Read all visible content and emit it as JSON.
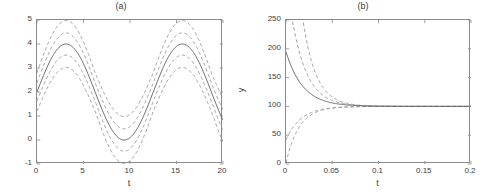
{
  "figure": {
    "width": 484,
    "height": 196,
    "background": "#ffffff",
    "axis_color": "#8a8a8a",
    "text_color": "#3c3c3c",
    "mean_line_color": "#555555",
    "band_line_color": "#8d8d8d"
  },
  "chart_data": [
    {
      "type": "line",
      "panel": "a",
      "title": "(a)",
      "xlabel": "t",
      "ylabel": "y",
      "xlim": [
        0,
        20
      ],
      "ylim": [
        -1,
        5
      ],
      "xticks": [
        0,
        5,
        10,
        15,
        20
      ],
      "xticklabels": [
        "0",
        "5",
        "10",
        "15",
        "20"
      ],
      "yticks": [
        -1,
        0,
        1,
        2,
        3,
        4,
        5
      ],
      "yticklabels": [
        "-1",
        "0",
        "1",
        "2",
        "3",
        "4",
        "5"
      ],
      "grid": false,
      "legend": null,
      "description": "Sinusoidal mean solution with four dashed confidence/percentile bands",
      "series": [
        {
          "name": "mean",
          "style": "solid",
          "color": "#555555",
          "model": "sine",
          "offset": 2.0,
          "amplitude": 2.0,
          "period": 12.5,
          "phase_t0_value": 2.0,
          "peaks_t": [
            3.1,
            15.6
          ],
          "peaks_y": [
            4.0,
            4.0
          ],
          "troughs_t": [
            9.4
          ],
          "troughs_y": [
            0.0
          ],
          "x": [
            0,
            1,
            2,
            3,
            4,
            5,
            6,
            7,
            8,
            9,
            10,
            11,
            12,
            13,
            14,
            15,
            16,
            17,
            18,
            19,
            20
          ],
          "values": [
            2.0,
            2.95,
            3.69,
            3.99,
            3.78,
            3.11,
            2.16,
            1.18,
            0.43,
            0.05,
            0.14,
            0.67,
            1.51,
            2.48,
            3.37,
            3.9,
            3.99,
            3.6,
            2.81,
            1.84,
            0.93
          ]
        },
        {
          "name": "band-inner-upper",
          "style": "dashed",
          "color": "#8d8d8d",
          "offset_from_mean": 0.38
        },
        {
          "name": "band-inner-lower",
          "style": "dashed",
          "color": "#8d8d8d",
          "offset_from_mean": -0.38
        },
        {
          "name": "band-outer-upper",
          "style": "dashed",
          "color": "#8d8d8d",
          "offset_from_mean": 0.8
        },
        {
          "name": "band-outer-lower",
          "style": "dashed",
          "color": "#8d8d8d",
          "offset_from_mean": -0.8
        }
      ]
    },
    {
      "type": "line",
      "panel": "b",
      "title": "(b)",
      "xlabel": "t",
      "ylabel": "y",
      "xlim": [
        0,
        0.2
      ],
      "ylim": [
        0,
        250
      ],
      "xticks": [
        0,
        0.05,
        0.1,
        0.15,
        0.2
      ],
      "xticklabels": [
        "0",
        "0.05",
        "0.1",
        "0.15",
        "0.2"
      ],
      "yticks": [
        0,
        50,
        100,
        150,
        200,
        250
      ],
      "yticklabels": [
        "0",
        "50",
        "100",
        "150",
        "200",
        "250"
      ],
      "grid": false,
      "legend": null,
      "description": "Exponential relaxation to steady state y=100 with four dashed bands collapsing onto the mean",
      "steady_state": 100,
      "series": [
        {
          "name": "mean",
          "style": "solid",
          "color": "#555555",
          "start_value": 195,
          "decay_rate": 55,
          "x": [
            0,
            0.01,
            0.02,
            0.03,
            0.04,
            0.05,
            0.06,
            0.08,
            0.1,
            0.15,
            0.2
          ],
          "values": [
            195,
            154.8,
            131.6,
            118.2,
            110.5,
            106.1,
            103.5,
            101.2,
            100.4,
            100.0,
            100.0
          ]
        },
        {
          "name": "band-inner-upper",
          "style": "dashed",
          "color": "#8d8d8d",
          "start_value": 330,
          "decay_rate": 62
        },
        {
          "name": "band-outer-upper",
          "style": "dashed",
          "color": "#8d8d8d",
          "start_value": 640,
          "decay_rate": 70
        },
        {
          "name": "band-inner-lower",
          "style": "dashed",
          "color": "#8d8d8d",
          "start_value": 42,
          "decay_rate": 62
        },
        {
          "name": "band-outer-lower",
          "style": "dashed",
          "color": "#8d8d8d",
          "start_value": 2,
          "decay_rate": 70
        }
      ]
    }
  ]
}
